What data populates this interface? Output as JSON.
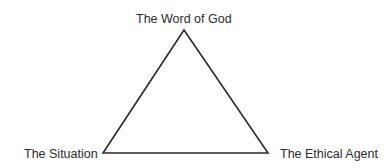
{
  "diagram": {
    "type": "triangle",
    "vertices": {
      "top": {
        "label": "The Word of God",
        "x": 184,
        "y": 30
      },
      "bottom_left": {
        "label": "The Situation",
        "x": 103,
        "y": 153
      },
      "bottom_right": {
        "label": "The Ethical Agent",
        "x": 268,
        "y": 153
      }
    },
    "stroke_color": "#2b2b2b",
    "text_color": "#2b2b2b",
    "background": "#ffffff"
  }
}
